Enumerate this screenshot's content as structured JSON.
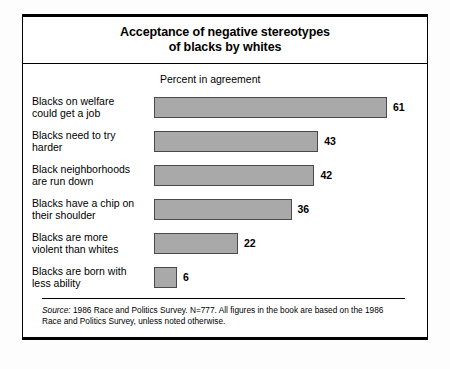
{
  "figure": {
    "title_line_1": "Acceptance of negative stereotypes",
    "title_line_2": "of blacks by whites",
    "source_label": "Source:",
    "source_text": " 1986 Race and Politics Survey. N=777. All figures in the book are based on the 1986 Race and Politics Survey, unless noted otherwise."
  },
  "chart_data": {
    "type": "bar",
    "orientation": "horizontal",
    "title": "Acceptance of negative stereotypes of blacks by whites",
    "xlabel": "Percent in agreement",
    "ylabel": "",
    "xlim": [
      0,
      61
    ],
    "grid": false,
    "legend": false,
    "categories": [
      "Blacks on welfare could get a job",
      "Blacks need to try harder",
      "Black neighborhoods are run down",
      "Blacks have a chip on their shoulder",
      "Blacks are more violent than whites",
      "Blacks are born with less ability"
    ],
    "category_lines": [
      [
        "Blacks on welfare",
        "could get a job"
      ],
      [
        "Blacks need to try",
        "harder"
      ],
      [
        "Black neighborhoods",
        "are run down"
      ],
      [
        "Blacks have a chip on",
        "their shoulder"
      ],
      [
        "Blacks are more",
        "violent than whites"
      ],
      [
        "Blacks are born with",
        "less ability"
      ]
    ],
    "values": [
      61,
      43,
      42,
      36,
      22,
      6
    ],
    "value_labels": [
      "61",
      "43",
      "42",
      "36",
      "22",
      "6"
    ],
    "bar_color": "#a9a9a9",
    "bar_border_color": "#4a4a4a"
  }
}
